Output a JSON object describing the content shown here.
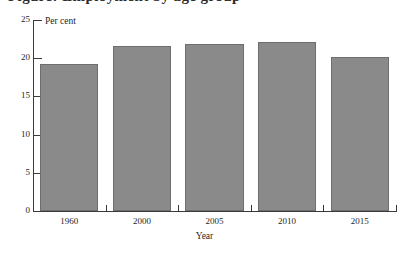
{
  "figure": {
    "clipped_title": "Figure: Employment by age group",
    "unit_label": "Per cent",
    "xaxis_title": "Year"
  },
  "chart_data": {
    "type": "bar",
    "title": "",
    "xlabel": "Year",
    "ylabel": "Per cent",
    "categories": [
      "1960",
      "2000",
      "2005",
      "2010",
      "2015"
    ],
    "values": [
      19.2,
      21.6,
      21.8,
      22.1,
      20.2
    ],
    "ylim": [
      0,
      25
    ],
    "yticks": [
      0,
      5,
      10,
      15,
      20,
      25
    ],
    "ytick_labels": [
      "0",
      "5",
      "10",
      "15",
      "20",
      "25"
    ],
    "grid": false,
    "legend": "none",
    "bar_color": "#8a8a8a",
    "bar_edge_color": "#6e6e6e",
    "axis_color": "#3a3a3a"
  }
}
